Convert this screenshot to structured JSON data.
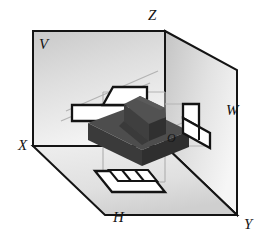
{
  "figure": {
    "kind": "orthographic-projection-diagram"
  },
  "labels": {
    "plane_vertical": "V",
    "plane_horizontal": "H",
    "plane_profile": "W",
    "axis_x": "X",
    "axis_y": "Y",
    "axis_z": "Z",
    "origin": "O"
  },
  "colors": {
    "outline": "#141414",
    "plane_fill_light": "#f2f2f2",
    "plane_fill_mid": "#d2d2d2",
    "plane_fill_dark": "#b9b9b9",
    "solid_top": "#4d4d4d",
    "solid_front": "#3a3a3a",
    "solid_side": "#2f2f2f",
    "projection_fill": "#ffffff",
    "guide_line": "#b0b0b0",
    "background": "#ffffff"
  },
  "geometry": {
    "vertical_plane_rect": [
      33,
      31,
      165,
      146
    ],
    "profile_plane_quad": "165,31 237,70 237,215 165,146",
    "horizontal_plane_quad": "33,146 165,146 237,215 105,215",
    "origin_point": [
      165,
      146
    ],
    "y_corner": [
      237,
      215
    ],
    "z_corner": [
      165,
      31
    ],
    "x_corner": [
      33,
      146
    ]
  },
  "projections": {
    "front_view_on_V": "stepped L-shaped outline with slanted upper face",
    "top_view_on_H": "parallelogram with two internal rectangular divisions",
    "side_view_on_W": "stepped profile made of two offset parallelograms"
  }
}
